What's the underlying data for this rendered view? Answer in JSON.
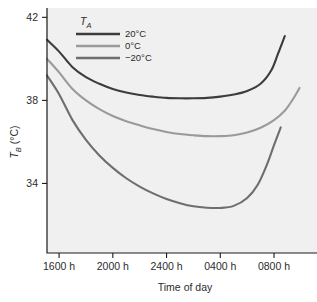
{
  "chart_data": {
    "type": "line",
    "title": "",
    "xlabel": "Time of day",
    "ylabel": "T_B (°C)",
    "ylabel_main": "T",
    "ylabel_sub": "B",
    "ylabel_unit": " (°C)",
    "grid": false,
    "legend_position": "top-left-inside",
    "legend_title": "T_A",
    "legend_title_main": "T",
    "legend_title_sub": "A",
    "x_tick_labels": [
      "1600 h",
      "2000 h",
      "2400 h",
      "0400 h",
      "0800 h"
    ],
    "x_tick_values": [
      1600,
      2000,
      2400,
      400,
      800
    ],
    "x_hours_from_start": [
      0,
      4,
      8,
      12,
      16
    ],
    "xlim_hours": [
      -0.9,
      19.2
    ],
    "y_tick_labels": [
      "42",
      "38",
      "34"
    ],
    "y_tick_values": [
      42,
      38,
      34
    ],
    "ylim": [
      30.65,
      42.45
    ],
    "series": [
      {
        "name": "20°C",
        "color": "#3c3c3c",
        "x": [
          -0.9,
          0.0,
          1.0,
          2.0,
          3.0,
          4.0,
          5.0,
          6.0,
          7.0,
          8.0,
          9.0,
          10.0,
          11.0,
          12.0,
          13.0,
          14.0,
          15.0,
          15.8,
          16.3,
          16.8
        ],
        "values": [
          40.92,
          40.35,
          39.6,
          39.12,
          38.8,
          38.55,
          38.38,
          38.26,
          38.18,
          38.12,
          38.1,
          38.1,
          38.12,
          38.18,
          38.28,
          38.45,
          38.8,
          39.45,
          40.25,
          41.1
        ]
      },
      {
        "name": "0°C",
        "color": "#9a9a9a",
        "x": [
          -0.9,
          0.0,
          1.0,
          2.0,
          3.0,
          4.0,
          5.0,
          6.0,
          7.0,
          8.0,
          9.0,
          10.0,
          11.0,
          12.0,
          13.0,
          14.0,
          15.0,
          16.0,
          16.8,
          17.4,
          17.9
        ],
        "values": [
          40.0,
          39.35,
          38.55,
          38.0,
          37.58,
          37.25,
          37.0,
          36.8,
          36.62,
          36.48,
          36.38,
          36.32,
          36.28,
          36.28,
          36.32,
          36.45,
          36.68,
          37.05,
          37.5,
          38.05,
          38.6
        ]
      },
      {
        "name": "−20°C",
        "color": "#6e6e6e",
        "x": [
          -0.9,
          0.0,
          1.0,
          2.0,
          3.0,
          4.0,
          5.0,
          6.0,
          7.0,
          8.0,
          9.0,
          10.0,
          11.0,
          12.0,
          13.0,
          14.0,
          14.8,
          15.5,
          16.0,
          16.5
        ],
        "values": [
          39.2,
          38.3,
          37.05,
          36.1,
          35.35,
          34.75,
          34.25,
          33.85,
          33.52,
          33.25,
          33.05,
          32.9,
          32.83,
          32.82,
          32.92,
          33.3,
          33.95,
          34.95,
          35.85,
          36.7
        ]
      }
    ],
    "legend_entries": [
      {
        "label": "20°C",
        "color": "#3c3c3c"
      },
      {
        "label": "0°C",
        "color": "#9a9a9a"
      },
      {
        "label": "−20°C",
        "color": "#6e6e6e"
      }
    ],
    "colors": {
      "plot_background": "#f0f0f0",
      "page_background": "#ffffff",
      "axis": "#1a1a1a",
      "text": "#2b2b2b"
    }
  }
}
